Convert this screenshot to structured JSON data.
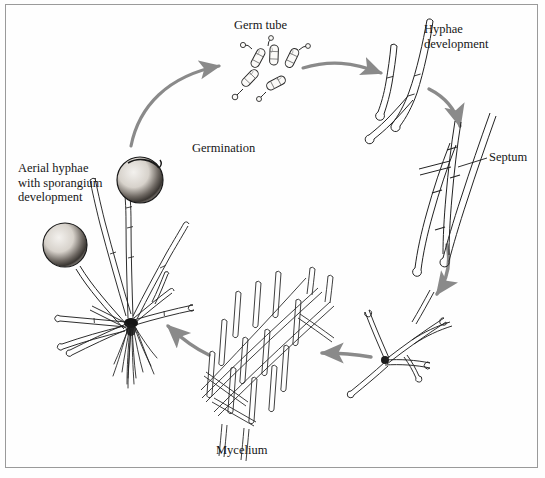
{
  "figure": {
    "type": "life-cycle-diagram",
    "background_color": "#fefefe",
    "border_color": "#9a9a9a",
    "ink_color": "#1a1a1a",
    "arrow_color": "#8a8a8a"
  },
  "labels": {
    "germ_tube": "Germ tube",
    "hyphae_development": "Hyphae\ndevelopment",
    "septum": "Septum",
    "germination": "Germination",
    "aerial_hyphae": "Aerial hyphae\nwith sporangium\ndevelopment",
    "mycelium": "Mycelium"
  },
  "stages": [
    {
      "id": "germ-tube",
      "label": "Germ tube",
      "position": "top-center",
      "description": "Cluster of capsule-shaped spores sprouting short germ tubes"
    },
    {
      "id": "hyphae-development",
      "label": "Hyphae development",
      "position": "top-right",
      "description": "Elongating hyphal filaments with rounded spore bases"
    },
    {
      "id": "septum",
      "label": "Septum",
      "position": "right",
      "description": "Branching hyphae showing cross-walls (septa)"
    },
    {
      "id": "branching-colony",
      "label": "",
      "position": "bottom-right",
      "description": "Radiating branched hyphae from a dense center"
    },
    {
      "id": "mycelium",
      "label": "Mycelium",
      "position": "bottom-center",
      "description": "Dense interwoven mat of hyphae"
    },
    {
      "id": "aerial-hyphae",
      "label": "Aerial hyphae with sporangium development",
      "position": "left",
      "description": "Colony with rhizoids and aerial stalks bearing shaded spherical sporangia"
    }
  ],
  "arrows": [
    {
      "id": "arrow-germination",
      "from": "aerial-hyphae",
      "to": "germ-tube",
      "label": "Germination",
      "direction": "up-right-curve"
    },
    {
      "id": "arrow-to-hyphae",
      "from": "germ-tube",
      "to": "hyphae-development",
      "label": "",
      "direction": "right"
    },
    {
      "id": "arrow-to-septum",
      "from": "hyphae-development",
      "to": "septum",
      "label": "",
      "direction": "down-right-curve"
    },
    {
      "id": "arrow-to-branching",
      "from": "septum",
      "to": "branching-colony",
      "label": "",
      "direction": "down-curve"
    },
    {
      "id": "arrow-to-mycelium",
      "from": "branching-colony",
      "to": "mycelium",
      "label": "",
      "direction": "left"
    },
    {
      "id": "arrow-to-aerial",
      "from": "mycelium",
      "to": "aerial-hyphae",
      "label": "",
      "direction": "up-left-curve"
    }
  ]
}
